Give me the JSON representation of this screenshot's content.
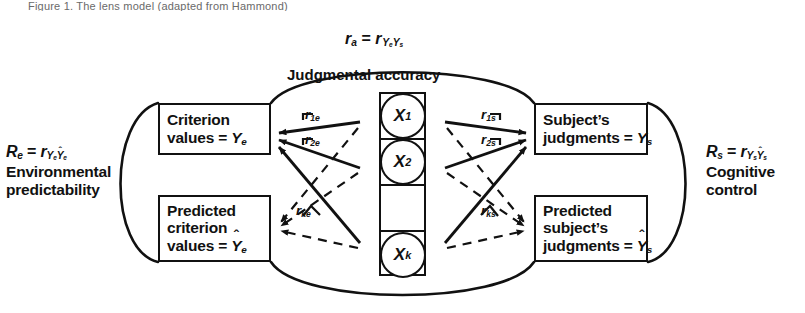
{
  "figure": {
    "caption_fragment": "Figure 1.  The lens model  (adapted from Hammond)",
    "top_relation": "r_a = r_{Y_e Y_s}",
    "top_arc_label": "Judgmental accuracy",
    "left_relation": "R_e = r_{Y_e Ŷ_e}",
    "left_arc_label_line1": "Environmental",
    "left_arc_label_line2": "predictability",
    "right_relation": "R_s = r_{Y_s Ŷ_s}",
    "right_arc_label_line1": "Cognitive",
    "right_arc_label_line2": "control"
  },
  "boxes": {
    "criterion": {
      "line1": "Criterion",
      "line2_prefix": "values = ",
      "symbol": "Y",
      "symbol_sub": "e",
      "hat": false
    },
    "predicted_criterion": {
      "line1": "Predicted",
      "line2": "criterion",
      "line3_prefix": "values = ",
      "symbol": "Y",
      "symbol_sub": "e",
      "hat": true
    },
    "subject_judgments": {
      "line1": "Subject’s",
      "line2_prefix": "judgments = ",
      "symbol": "Y",
      "symbol_sub": "s",
      "hat": false
    },
    "predicted_subject_judgments": {
      "line1": "Predicted",
      "line2": "subject’s",
      "line3_prefix": "judgments = ",
      "symbol": "Y",
      "symbol_sub": "s",
      "hat": true
    }
  },
  "cues": [
    {
      "symbol": "X",
      "sub": "1"
    },
    {
      "symbol": "X",
      "sub": "2"
    },
    {
      "symbol": "",
      "sub": ""
    },
    {
      "symbol": "X",
      "sub": "k"
    }
  ],
  "cue_validities": {
    "environment": [
      {
        "symbol": "r",
        "sub": "1e"
      },
      {
        "symbol": "r",
        "sub": "2e"
      },
      {
        "symbol": "r",
        "sub": "ke"
      }
    ],
    "subject": [
      {
        "symbol": "r",
        "sub": "1s"
      },
      {
        "symbol": "r",
        "sub": "2s"
      },
      {
        "symbol": "r",
        "sub": "ks"
      }
    ]
  },
  "symbols": {
    "r": "r",
    "R": "R",
    "Y": "Y",
    "X": "X",
    "equals": "=",
    "hat": "ˆ",
    "sub_a": "a",
    "sub_e": "e",
    "sub_s": "s"
  },
  "colors": {
    "ink": "#111111",
    "paper": "#ffffff",
    "caption": "#6a6a6a"
  }
}
